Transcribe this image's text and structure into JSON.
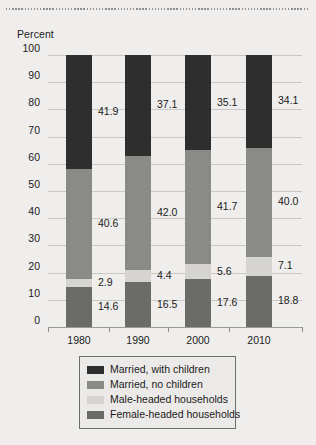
{
  "figure": {
    "axis_title": "Percent"
  },
  "chart_data": {
    "type": "bar",
    "subtype": "stacked-bar-100",
    "title": "",
    "xlabel": "",
    "ylabel": "Percent",
    "ylim": [
      0,
      100
    ],
    "ytick_labels": [
      "100",
      "90",
      "80",
      "70",
      "60",
      "50",
      "40",
      "30",
      "20",
      "10",
      "0"
    ],
    "ytick_values": [
      100,
      90,
      80,
      70,
      60,
      50,
      40,
      30,
      20,
      10,
      0
    ],
    "grid": true,
    "legend_position": "bottom",
    "categories": [
      "1980",
      "1990",
      "2000",
      "2010"
    ],
    "series": [
      {
        "name": "Married, with children",
        "color": "#2e2e2e",
        "values": [
          41.9,
          37.1,
          35.1,
          34.1
        ],
        "labels": [
          "41.9",
          "37.1",
          "35.1",
          "34.1"
        ]
      },
      {
        "name": "Married, no children",
        "color": "#8a8a87",
        "values": [
          40.6,
          42.0,
          41.7,
          40.0
        ],
        "labels": [
          "40.6",
          "42.0",
          "41.7",
          "40.0"
        ]
      },
      {
        "name": "Male-headed households",
        "color": "#d5d4d1",
        "values": [
          2.9,
          4.4,
          5.6,
          7.1
        ],
        "labels": [
          "2.9",
          "4.4",
          "5.6",
          "7.1"
        ]
      },
      {
        "name": "Female-headed households",
        "color": "#6b6b68",
        "values": [
          14.6,
          16.5,
          17.6,
          18.8
        ],
        "labels": [
          "14.6",
          "16.5",
          "17.6",
          "18.8"
        ]
      }
    ]
  }
}
